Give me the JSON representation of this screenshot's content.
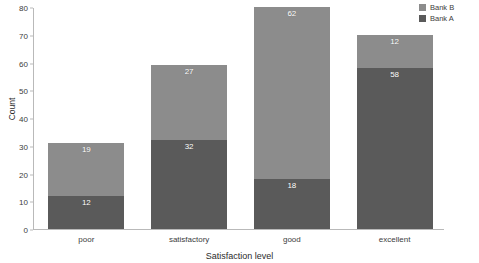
{
  "chart_data": {
    "type": "bar",
    "stacked": true,
    "title": "",
    "xlabel": "Satisfaction level",
    "ylabel": "Count",
    "categories": [
      "poor",
      "satisfactory",
      "good",
      "excellent"
    ],
    "series": [
      {
        "name": "Bank A",
        "color": "#5a5a5a",
        "values": [
          12,
          32,
          18,
          58
        ]
      },
      {
        "name": "Bank B",
        "color": "#8c8c8c",
        "values": [
          19,
          27,
          62,
          12
        ]
      }
    ],
    "stack_order_bottom_to_top": [
      "Bank A",
      "Bank B"
    ],
    "totals": [
      31,
      59,
      80,
      70
    ],
    "ylim": [
      0,
      80
    ],
    "yticks": [
      0,
      10,
      20,
      30,
      40,
      50,
      60,
      70,
      80
    ],
    "ytick_labels": [
      "0",
      "10",
      "20",
      "30",
      "40",
      "50",
      "60",
      "70",
      "80"
    ],
    "grid": false,
    "legend_position": "top-right",
    "legend_entries": [
      {
        "label": "Bank B",
        "color": "#8c8c8c"
      },
      {
        "label": "Bank A",
        "color": "#5a5a5a"
      }
    ],
    "data_labels": [
      {
        "category": "poor",
        "series": "Bank B",
        "value": 19
      },
      {
        "category": "poor",
        "series": "Bank A",
        "value": 12
      },
      {
        "category": "satisfactory",
        "series": "Bank B",
        "value": 27
      },
      {
        "category": "satisfactory",
        "series": "Bank A",
        "value": 32
      },
      {
        "category": "good",
        "series": "Bank B",
        "value": 62
      },
      {
        "category": "good",
        "series": "Bank A",
        "value": 18
      },
      {
        "category": "excellent",
        "series": "Bank B",
        "value": 12
      },
      {
        "category": "excellent",
        "series": "Bank A",
        "value": 58
      }
    ],
    "background_color": "#ffffff",
    "axis_color": "#b9b9b9",
    "text_color": "#3c3c3c"
  }
}
